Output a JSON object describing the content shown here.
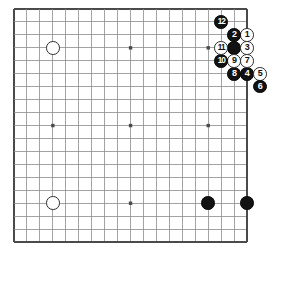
{
  "figure": {
    "kind": "go-board-diagram",
    "board_size": 19,
    "colors": {
      "background": "#ffffff",
      "grid_line": "#8c8c8c",
      "border_line": "#4a4a4a",
      "black_stone": "#121212",
      "white_stone": "#ffffff",
      "stone_outline": "#2b2b2b",
      "black_label": "#ffffff",
      "white_label": "#111111"
    },
    "geometry": {
      "origin_x": 14,
      "origin_y": 9,
      "spacing": 12.95,
      "stone_diameter": 13.6,
      "star_point_size": 3.4
    },
    "star_points": [
      {
        "col": 3,
        "row": 3
      },
      {
        "col": 9,
        "row": 3
      },
      {
        "col": 15,
        "row": 3
      },
      {
        "col": 3,
        "row": 9
      },
      {
        "col": 9,
        "row": 9
      },
      {
        "col": 15,
        "row": 9
      },
      {
        "col": 3,
        "row": 15
      },
      {
        "col": 9,
        "row": 15
      },
      {
        "col": 15,
        "row": 15
      }
    ],
    "stones": [
      {
        "id": "w-upper-left-hoshi",
        "color": "white",
        "label": "",
        "col": 3,
        "row": 3
      },
      {
        "id": "w-lower-left-hoshi",
        "color": "white",
        "label": "",
        "col": 3,
        "row": 15
      },
      {
        "id": "b-lower-right-a",
        "color": "black",
        "label": "",
        "col": 15,
        "row": 15
      },
      {
        "id": "b-lower-right-b",
        "color": "black",
        "label": "",
        "col": 18,
        "row": 15
      },
      {
        "id": "b-upper-right-corner",
        "color": "black",
        "label": "",
        "col": 17,
        "row": 3
      },
      {
        "id": "move-1",
        "color": "white",
        "label": "1",
        "col": 18,
        "row": 2
      },
      {
        "id": "move-2",
        "color": "black",
        "label": "2",
        "col": 17,
        "row": 2
      },
      {
        "id": "move-3",
        "color": "white",
        "label": "3",
        "col": 18,
        "row": 3
      },
      {
        "id": "move-4",
        "color": "black",
        "label": "4",
        "col": 18,
        "row": 5
      },
      {
        "id": "move-5",
        "color": "white",
        "label": "5",
        "col": 19,
        "row": 5
      },
      {
        "id": "move-6",
        "color": "black",
        "label": "6",
        "col": 19,
        "row": 6
      },
      {
        "id": "move-7",
        "color": "white",
        "label": "7",
        "col": 18,
        "row": 4
      },
      {
        "id": "move-8",
        "color": "black",
        "label": "8",
        "col": 17,
        "row": 5
      },
      {
        "id": "move-9",
        "color": "white",
        "label": "9",
        "col": 17,
        "row": 4
      },
      {
        "id": "move-10",
        "color": "black",
        "label": "10",
        "col": 16,
        "row": 4
      },
      {
        "id": "move-11",
        "color": "white",
        "label": "11",
        "col": 16,
        "row": 3
      },
      {
        "id": "move-12",
        "color": "black",
        "label": "12",
        "col": 16,
        "row": 1
      }
    ]
  }
}
